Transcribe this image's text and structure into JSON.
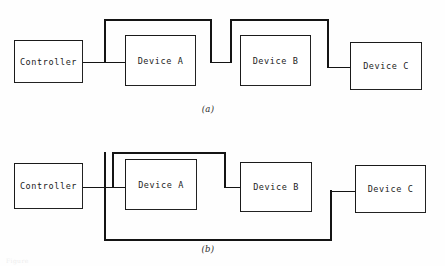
{
  "figure": {
    "background_color": "#fefefe",
    "ink_color": "#141414"
  },
  "diagrams": [
    {
      "id": "diagram-a",
      "caption": "(a)",
      "topology": "daisy-chain",
      "nodes": [
        {
          "id": "controller",
          "label": "Controller",
          "x": 14,
          "y": 40,
          "w": 69,
          "h": 43
        },
        {
          "id": "device-a",
          "label": "Device A",
          "x": 125,
          "y": 35,
          "w": 71,
          "h": 51
        },
        {
          "id": "device-b",
          "label": "Device B",
          "x": 240,
          "y": 35,
          "w": 71,
          "h": 51
        },
        {
          "id": "device-c",
          "label": "Device C",
          "x": 350,
          "y": 42,
          "w": 72,
          "h": 48
        }
      ],
      "links": [
        {
          "from": "controller",
          "to": "device-a",
          "style": "loop-over"
        },
        {
          "from": "device-a",
          "to": "device-b",
          "style": "loop-over"
        },
        {
          "from": "device-b",
          "to": "device-c",
          "style": "direct"
        }
      ]
    },
    {
      "id": "diagram-b",
      "caption": "(b)",
      "topology": "bus",
      "nodes": [
        {
          "id": "controller",
          "label": "Controller",
          "x": 14,
          "y": 163,
          "w": 69,
          "h": 46
        },
        {
          "id": "device-a",
          "label": "Device A",
          "x": 125,
          "y": 159,
          "w": 72,
          "h": 51
        },
        {
          "id": "device-b",
          "label": "Device B",
          "x": 240,
          "y": 162,
          "w": 72,
          "h": 50
        },
        {
          "id": "device-c",
          "label": "Device C",
          "x": 355,
          "y": 165,
          "w": 71,
          "h": 48
        }
      ],
      "links": [
        {
          "from": "controller",
          "to": "device-a",
          "style": "direct-through-bus"
        },
        {
          "from": "bus",
          "to": "device-b",
          "style": "top-rail"
        },
        {
          "from": "device-c",
          "to": "bus",
          "style": "bottom-return"
        }
      ]
    }
  ],
  "footnote": "Figure"
}
